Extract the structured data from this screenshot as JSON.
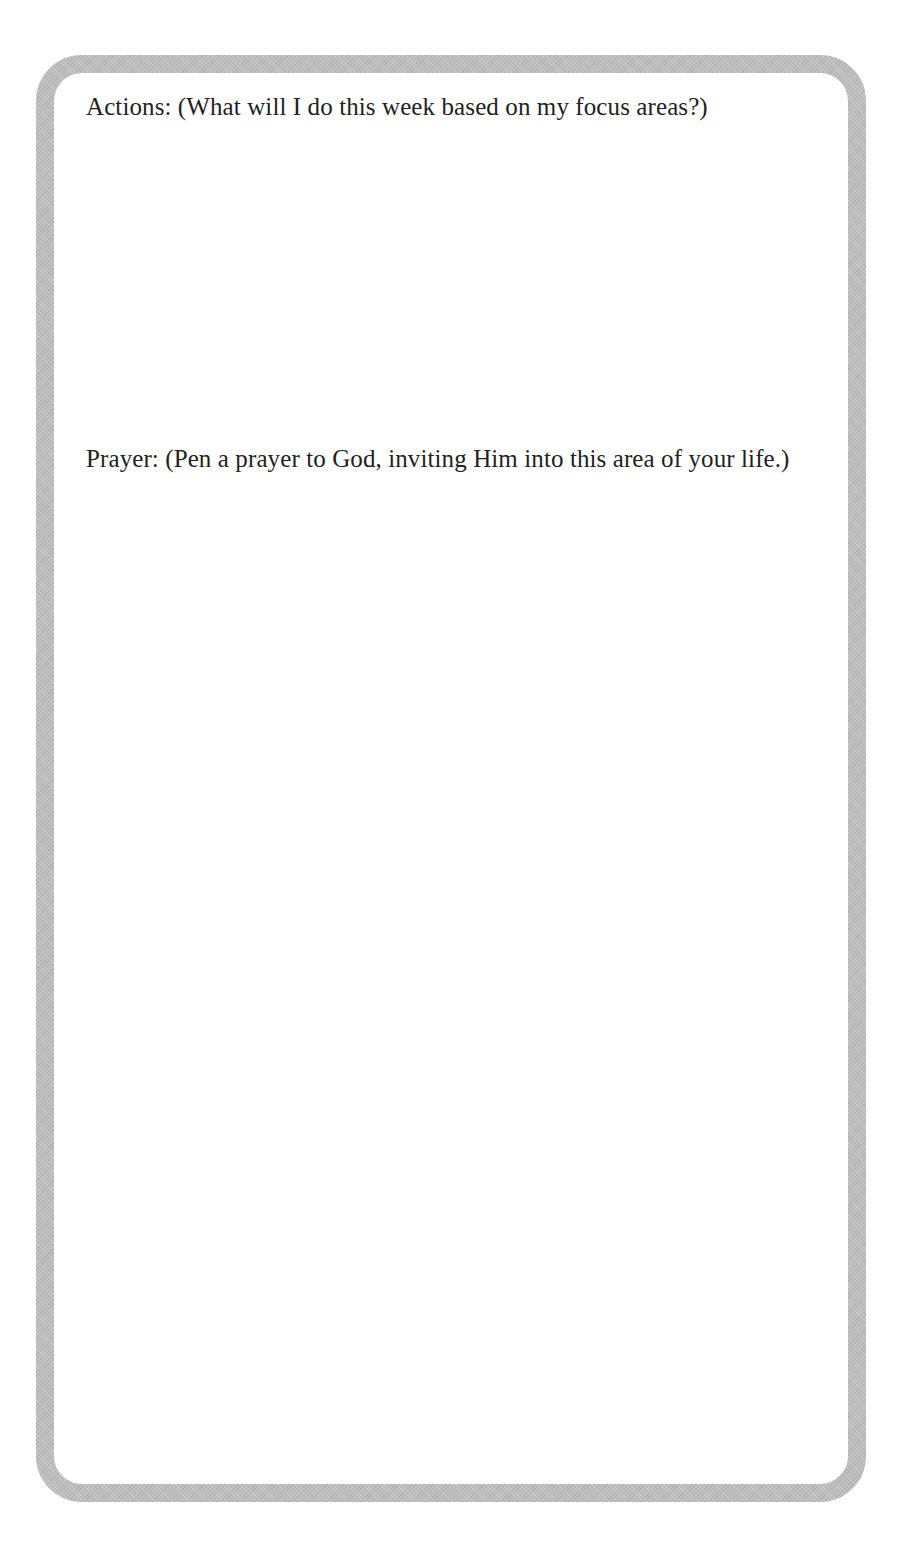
{
  "page": {
    "cut_off_heading_fragment": "g  g  ,"
  },
  "card": {
    "border_color": "#bdbdbd",
    "text_color": "#231f20",
    "sections": [
      {
        "id": "actions",
        "prompt": "Actions: (What will I do this week based on my focus areas?)"
      },
      {
        "id": "prayer",
        "prompt": "Prayer: (Pen a prayer to God, inviting Him into this area of your life.)"
      }
    ]
  }
}
